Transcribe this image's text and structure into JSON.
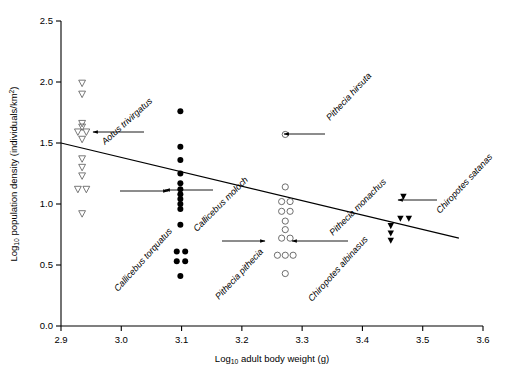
{
  "chart_data": {
    "type": "scatter",
    "title": "",
    "xlabel": "Log10 adult body weight (g)",
    "ylabel": "Log10 population density (individuals/km2)",
    "xlabel_parts": {
      "prefix": "Log",
      "sub": "10",
      "rest": " adult body weight (g)"
    },
    "ylabel_parts": {
      "prefix": "Log",
      "sub": "10",
      "rest": " population density (individuals/km",
      "sup": "2",
      "tail": ")"
    },
    "xlim": [
      2.9,
      3.6
    ],
    "ylim": [
      0.0,
      2.5
    ],
    "xticks": [
      "2.9",
      "3.0",
      "3.1",
      "3.2",
      "3.3",
      "3.4",
      "3.5",
      "3.6"
    ],
    "xtick_values": [
      2.9,
      3.0,
      3.1,
      3.2,
      3.3,
      3.4,
      3.5,
      3.6
    ],
    "yticks": [
      "0.0",
      "0.5",
      "1.0",
      "1.5",
      "2.0",
      "2.5"
    ],
    "ytick_values": [
      0.0,
      0.5,
      1.0,
      1.5,
      2.0,
      2.5
    ],
    "grid": false,
    "legend": "none",
    "regression_line": {
      "label": "fitted regression line",
      "x_start": 2.9,
      "y_start": 1.5,
      "x_end": 3.56,
      "y_end": 0.72
    },
    "series": [
      {
        "name": "Aotus trivirgatus",
        "marker": "open-triangle-down",
        "x": [
          2.935,
          2.935,
          2.935,
          2.935,
          2.928,
          2.942,
          2.935,
          2.935,
          2.935,
          2.935,
          2.928,
          2.942,
          2.935
        ],
        "y": [
          1.99,
          1.9,
          1.66,
          1.63,
          1.59,
          1.59,
          1.53,
          1.37,
          1.3,
          1.23,
          1.12,
          1.12,
          0.92
        ]
      },
      {
        "name": "Callicebus torquatus / Callicebus moloch",
        "marker": "filled-circle",
        "x": [
          3.098,
          3.098,
          3.098,
          3.098,
          3.098,
          3.098,
          3.098,
          3.098,
          3.098,
          3.098,
          3.098,
          3.092,
          3.106,
          3.092,
          3.106,
          3.098
        ],
        "y": [
          1.76,
          1.47,
          1.36,
          1.25,
          1.17,
          1.12,
          1.08,
          1.04,
          1.0,
          0.96,
          0.83,
          0.61,
          0.61,
          0.53,
          0.53,
          0.41
        ]
      },
      {
        "name": "Pithecia hirsuta",
        "marker": "open-circle",
        "x": [
          3.272
        ],
        "y": [
          1.57
        ]
      },
      {
        "name": "Pithecia pithecia / Pithecia monachus",
        "marker": "open-circle",
        "x": [
          3.272,
          3.266,
          3.28,
          3.266,
          3.28,
          3.272,
          3.272,
          3.266,
          3.28,
          3.259,
          3.272,
          3.285,
          3.272
        ],
        "y": [
          1.14,
          1.02,
          1.02,
          0.94,
          0.94,
          0.86,
          0.79,
          0.72,
          0.72,
          0.58,
          0.58,
          0.58,
          0.43
        ]
      },
      {
        "name": "Chiropotes albinasus / Chiropotes satanas",
        "marker": "filled-triangle",
        "x": [
          3.468,
          3.463,
          3.477,
          3.447,
          3.447,
          3.447
        ],
        "y": [
          1.06,
          0.88,
          0.88,
          0.82,
          0.76,
          0.7
        ]
      }
    ],
    "annotations": [
      {
        "id": "aotus",
        "text": "Aotus trivirgatus",
        "rotation": -42,
        "tx": 105,
        "ty": 145,
        "leader": {
          "x1": 144,
          "y1": 132,
          "x2": 93,
          "y2": 132,
          "arrow": "left"
        }
      },
      {
        "id": "callicebus-torq",
        "text": "Callicebus torquatus",
        "rotation": -48,
        "tx": 118,
        "ty": 292,
        "leader": {
          "x1": 120,
          "y1": 191,
          "x2": 168,
          "y2": 191,
          "arrow": "right"
        }
      },
      {
        "id": "callicebus-moloch",
        "text": "Callicebus moloch",
        "rotation": -45,
        "tx": 197,
        "ty": 232,
        "leader": {
          "x1": 213,
          "y1": 190,
          "x2": 165,
          "y2": 190,
          "arrow": "left"
        }
      },
      {
        "id": "pithecia-hirsuta",
        "text": "Pithecia hirsuta",
        "rotation": -47,
        "tx": 330,
        "ty": 121,
        "leader": {
          "x1": 325,
          "y1": 134,
          "x2": 284,
          "y2": 134,
          "arrow": "left"
        }
      },
      {
        "id": "pithecia-pithecia",
        "text": "Pithecia pithecia",
        "rotation": -47,
        "tx": 219,
        "ty": 300,
        "leader": {
          "x1": 222,
          "y1": 241,
          "x2": 265,
          "y2": 241,
          "arrow": "right"
        }
      },
      {
        "id": "pithecia-monachus",
        "text": "Pithecia monachus",
        "rotation": -45,
        "tx": 333,
        "ty": 236,
        "leader": {
          "x1": 348,
          "y1": 241,
          "x2": 292,
          "y2": 241,
          "arrow": "left"
        }
      },
      {
        "id": "chiropotes-albi",
        "text": "Chiropotes albinasus",
        "rotation": -48,
        "tx": 312,
        "ty": 302,
        "leader": null
      },
      {
        "id": "chiropotes-satanas",
        "text": "Chiropotes satanas",
        "rotation": -47,
        "tx": 440,
        "ty": 214,
        "leader": {
          "x1": 437,
          "y1": 200,
          "x2": 398,
          "y2": 200,
          "arrow": "left"
        }
      }
    ]
  },
  "figure": {
    "background": "#ffffff",
    "ink": "#000000",
    "marker_open_stroke": "#555555"
  }
}
